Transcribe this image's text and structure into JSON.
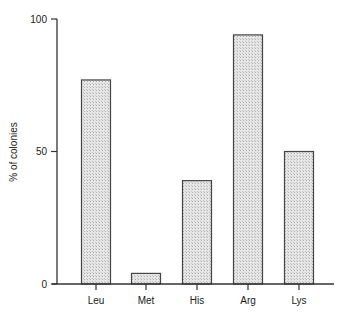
{
  "chart_data": {
    "type": "bar",
    "title": "",
    "xlabel": "",
    "ylabel": "% of colonies",
    "categories": [
      "Leu",
      "Met",
      "His",
      "Arg",
      "Lys"
    ],
    "values": [
      77,
      4,
      39,
      94,
      50
    ],
    "ylim": [
      0,
      100
    ],
    "yticks": [
      0,
      50,
      100
    ],
    "ytick_labels": [
      "0",
      "50",
      "100"
    ],
    "grid": false,
    "legend": "none",
    "bar_fill": "#d9d9d9",
    "bar_stroke": "#444444"
  }
}
